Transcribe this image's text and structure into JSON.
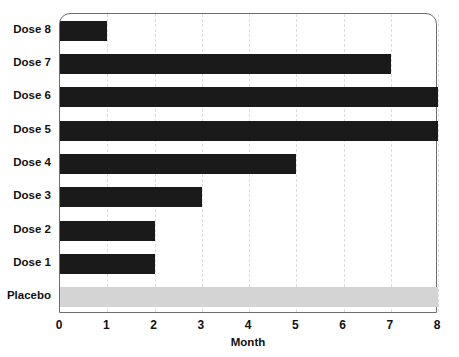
{
  "chart_data": {
    "type": "bar",
    "orientation": "horizontal",
    "title": "",
    "xlabel": "Month",
    "ylabel": "",
    "categories": [
      "Dose 8",
      "Dose 7",
      "Dose 6",
      "Dose 5",
      "Dose 4",
      "Dose 3",
      "Dose 2",
      "Dose 1",
      "Placebo"
    ],
    "values": [
      1,
      7,
      8,
      8,
      5,
      3,
      2,
      2,
      8
    ],
    "xlim": [
      0,
      8
    ],
    "xticks": [
      0,
      1,
      2,
      3,
      4,
      5,
      6,
      7,
      8
    ],
    "xtick_labels": [
      "0",
      "1",
      "2",
      "3",
      "4",
      "5",
      "6",
      "7",
      "8"
    ],
    "grid": "vertical-dashed",
    "legend": "none",
    "bar_colors": [
      "#1a1a1a",
      "#1a1a1a",
      "#1a1a1a",
      "#1a1a1a",
      "#1a1a1a",
      "#1a1a1a",
      "#1a1a1a",
      "#1a1a1a",
      "#d4d4d4"
    ],
    "series": [
      {
        "name": "Month",
        "values": [
          1,
          7,
          8,
          8,
          5,
          3,
          2,
          2,
          8
        ]
      }
    ],
    "points": [
      {
        "category": "Dose 8",
        "value": 1,
        "color": "#1a1a1a"
      },
      {
        "category": "Dose 7",
        "value": 7,
        "color": "#1a1a1a"
      },
      {
        "category": "Dose 6",
        "value": 8,
        "color": "#1a1a1a"
      },
      {
        "category": "Dose 5",
        "value": 8,
        "color": "#1a1a1a"
      },
      {
        "category": "Dose 4",
        "value": 5,
        "color": "#1a1a1a"
      },
      {
        "category": "Dose 3",
        "value": 3,
        "color": "#1a1a1a"
      },
      {
        "category": "Dose 2",
        "value": 2,
        "color": "#1a1a1a"
      },
      {
        "category": "Dose 1",
        "value": 2,
        "color": "#1a1a1a"
      },
      {
        "category": "Placebo",
        "value": 8,
        "color": "#d4d4d4"
      }
    ],
    "colors": {
      "bar_dark": "#1a1a1a",
      "bar_light": "#d4d4d4",
      "frame": "#6e6e6e",
      "gridline": "#dedede",
      "text": "#111111",
      "background": "#ffffff"
    }
  }
}
